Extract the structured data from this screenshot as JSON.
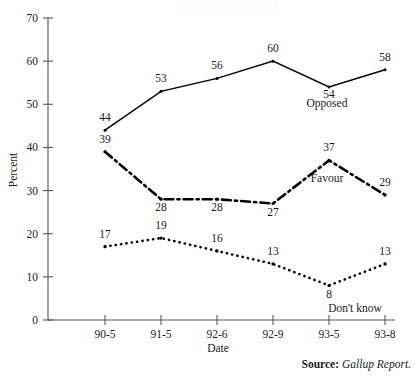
{
  "chart_data": {
    "type": "line",
    "title": "",
    "xlabel": "Date",
    "ylabel": "Percent",
    "categories": [
      "90-5",
      "91-5",
      "92-6",
      "92-9",
      "93-5",
      "93-8"
    ],
    "ylim": [
      0,
      70
    ],
    "yticks": [
      0,
      10,
      20,
      30,
      40,
      50,
      60,
      70
    ],
    "grid": false,
    "legend_position": "inline-right",
    "series": [
      {
        "name": "Opposed",
        "style": "solid",
        "values": [
          44,
          53,
          56,
          60,
          54,
          58
        ]
      },
      {
        "name": "Favour",
        "style": "dash-dot",
        "values": [
          39,
          28,
          28,
          27,
          37,
          29
        ]
      },
      {
        "name": "Don't know",
        "style": "dotted",
        "values": [
          17,
          19,
          16,
          13,
          8,
          13
        ]
      }
    ],
    "annotations": {
      "source_label": "Source:",
      "source_value": "Gallup Report."
    }
  }
}
